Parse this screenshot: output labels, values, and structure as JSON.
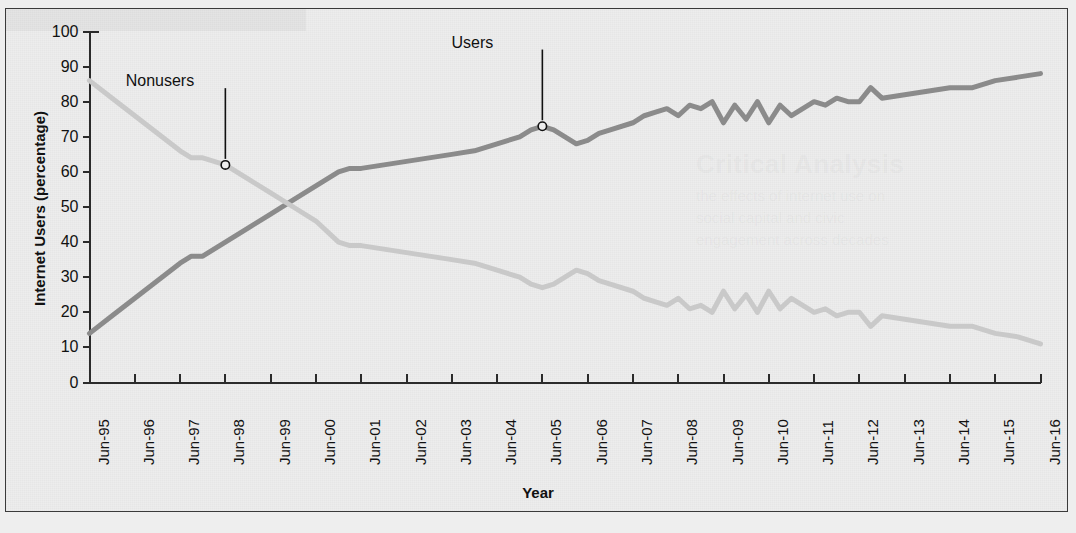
{
  "figure": {
    "frame_color": "#3a3a3a",
    "background": "#ededed"
  },
  "ghost_text": {
    "heading": "Critical Analysis",
    "line1": "the effects of internet use on",
    "line2": "social capital and civic",
    "line3": "engagement across decades"
  },
  "chart_data": {
    "type": "line",
    "title": "",
    "xlabel": "Year",
    "ylabel": "Internet Users (percentage)",
    "ylim": [
      0,
      100
    ],
    "ytick_values": [
      0,
      10,
      20,
      30,
      40,
      50,
      60,
      70,
      80,
      90,
      100
    ],
    "grid": false,
    "legend": "annotations",
    "categories": [
      "Jun-95",
      "Jun-96",
      "Jun-97",
      "Jun-98",
      "Jun-99",
      "Jun-00",
      "Jun-01",
      "Jun-02",
      "Jun-03",
      "Jun-04",
      "Jun-05",
      "Jun-06",
      "Jun-07",
      "Jun-08",
      "Jun-09",
      "Jun-10",
      "Jun-11",
      "Jun-12",
      "Jun-13",
      "Jun-14",
      "Jun-15",
      "Jun-16"
    ],
    "x_start": 1995.5,
    "x_end": 2016.5,
    "series": [
      {
        "name": "Users",
        "color": "#8b8b8b",
        "x": [
          1995.5,
          1996.0,
          1996.5,
          1997.0,
          1997.5,
          1997.75,
          1998.0,
          1998.5,
          1999.0,
          1999.5,
          2000.0,
          2000.5,
          2001.0,
          2001.25,
          2001.5,
          2002.0,
          2002.5,
          2003.0,
          2003.5,
          2004.0,
          2004.5,
          2005.0,
          2005.25,
          2005.5,
          2005.75,
          2006.0,
          2006.25,
          2006.5,
          2006.75,
          2007.0,
          2007.5,
          2007.75,
          2008.0,
          2008.25,
          2008.5,
          2008.75,
          2009.0,
          2009.25,
          2009.5,
          2009.75,
          2010.0,
          2010.25,
          2010.5,
          2010.75,
          2011.0,
          2011.5,
          2011.75,
          2012.0,
          2012.25,
          2012.5,
          2012.75,
          2013.0,
          2013.5,
          2014.0,
          2014.5,
          2015.0,
          2015.5,
          2016.0,
          2016.5
        ],
        "y": [
          14,
          19,
          24,
          29,
          34,
          36,
          36,
          40,
          44,
          48,
          52,
          56,
          60,
          61,
          61,
          62,
          63,
          64,
          65,
          66,
          68,
          70,
          72,
          73,
          72,
          70,
          68,
          69,
          71,
          72,
          74,
          76,
          77,
          78,
          76,
          79,
          78,
          80,
          74,
          79,
          75,
          80,
          74,
          79,
          76,
          80,
          79,
          81,
          80,
          80,
          84,
          81,
          82,
          83,
          84,
          84,
          86,
          87,
          88
        ]
      },
      {
        "name": "Nonusers",
        "color": "#c9c9c9",
        "x": [
          1995.5,
          1996.0,
          1996.5,
          1997.0,
          1997.5,
          1997.75,
          1998.0,
          1998.5,
          1999.0,
          1999.5,
          2000.0,
          2000.5,
          2001.0,
          2001.25,
          2001.5,
          2002.0,
          2002.5,
          2003.0,
          2003.5,
          2004.0,
          2004.5,
          2005.0,
          2005.25,
          2005.5,
          2005.75,
          2006.0,
          2006.25,
          2006.5,
          2006.75,
          2007.0,
          2007.5,
          2007.75,
          2008.0,
          2008.25,
          2008.5,
          2008.75,
          2009.0,
          2009.25,
          2009.5,
          2009.75,
          2010.0,
          2010.25,
          2010.5,
          2010.75,
          2011.0,
          2011.5,
          2011.75,
          2012.0,
          2012.25,
          2012.5,
          2012.75,
          2013.0,
          2013.5,
          2014.0,
          2014.5,
          2015.0,
          2015.5,
          2016.0,
          2016.5
        ],
        "y": [
          86,
          81,
          76,
          71,
          66,
          64,
          64,
          62,
          58,
          54,
          50,
          46,
          40,
          39,
          39,
          38,
          37,
          36,
          35,
          34,
          32,
          30,
          28,
          27,
          28,
          30,
          32,
          31,
          29,
          28,
          26,
          24,
          23,
          22,
          24,
          21,
          22,
          20,
          26,
          21,
          25,
          20,
          26,
          21,
          24,
          20,
          21,
          19,
          20,
          20,
          16,
          19,
          18,
          17,
          16,
          16,
          14,
          13,
          11
        ]
      }
    ],
    "annotations": [
      {
        "label": "Users",
        "target_x": 2005.5,
        "target_y": 73,
        "text_x": 2004.0,
        "text_y": 96,
        "marker": "open-circle"
      },
      {
        "label": "Nonusers",
        "target_x": 1998.5,
        "target_y": 62,
        "text_x": 1997.1,
        "text_y": 85,
        "marker": "open-circle"
      }
    ]
  }
}
